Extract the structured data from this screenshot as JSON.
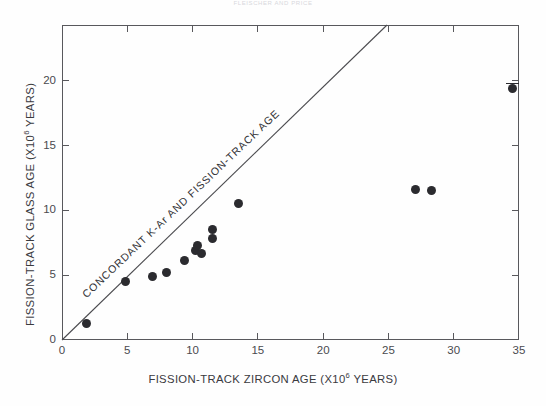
{
  "running_head": "FLEISCHER AND PRICE",
  "chart_data": {
    "type": "scatter",
    "title": "",
    "xlabel": "FISSION-TRACK ZIRCON AGE (X10",
    "xlabel_sup": "6",
    "xlabel_tail": " YEARS)",
    "ylabel": "FISSION-TRACK GLASS AGE (X10",
    "ylabel_sup": "6",
    "ylabel_tail": " YEARS)",
    "xlim": [
      0,
      35
    ],
    "ylim": [
      0,
      24.3
    ],
    "xticks": [
      0,
      5,
      10,
      15,
      20,
      25,
      30,
      35
    ],
    "yticks": [
      0,
      5,
      10,
      15,
      20
    ],
    "xtick_labels": [
      "0",
      "5",
      "10",
      "15",
      "20",
      "25",
      "30",
      "35"
    ],
    "ytick_labels": [
      "0",
      "5",
      "10",
      "15",
      "20"
    ],
    "grid": false,
    "legend": "none",
    "marker_color": "#2b2b2f",
    "axis_color": "#58585c",
    "annotations": [
      {
        "name": "concordant-line-label",
        "text": "CONCORDANT  K-Ar AND FISSION-TRACK AGE"
      }
    ],
    "reference_line": {
      "name": "concordia-1to1-line",
      "label": "CONCORDANT  K-Ar AND FISSION-TRACK AGE",
      "slope": 1,
      "intercept": 0,
      "x_from": 0,
      "x_to": 24.3
    },
    "points": [
      {
        "x": 1.9,
        "y": 1.3
      },
      {
        "x": 4.9,
        "y": 4.5
      },
      {
        "x": 6.9,
        "y": 4.9
      },
      {
        "x": 8.0,
        "y": 5.2
      },
      {
        "x": 9.4,
        "y": 6.1
      },
      {
        "x": 10.2,
        "y": 6.9
      },
      {
        "x": 10.7,
        "y": 6.7
      },
      {
        "x": 10.4,
        "y": 7.3
      },
      {
        "x": 11.5,
        "y": 8.5
      },
      {
        "x": 11.5,
        "y": 7.8
      },
      {
        "x": 13.5,
        "y": 10.5
      },
      {
        "x": 27.1,
        "y": 11.6
      },
      {
        "x": 28.3,
        "y": 11.5
      },
      {
        "x": 34.5,
        "y": 19.4,
        "err_y_top": 0.45
      }
    ]
  }
}
